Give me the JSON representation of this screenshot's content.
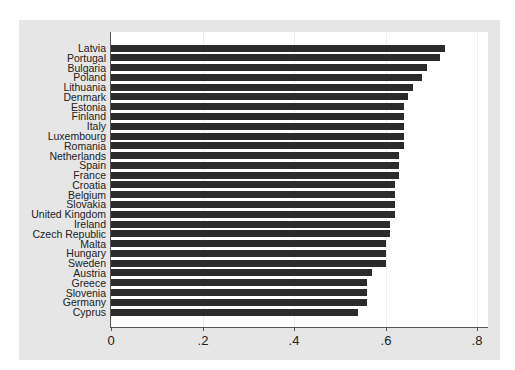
{
  "chart_data": {
    "type": "bar",
    "orientation": "horizontal",
    "title": "",
    "xlabel": "",
    "ylabel": "",
    "xlim": [
      0,
      0.82
    ],
    "xticks": [
      0,
      0.2,
      0.4,
      0.6,
      0.8
    ],
    "xtick_labels": [
      "0",
      ".2",
      ".4",
      ".6",
      ".8"
    ],
    "grid": true,
    "legend": null,
    "categories": [
      "Latvia",
      "Portugal",
      "Bulgaria",
      "Poland",
      "Lithuania",
      "Denmark",
      "Estonia",
      "Finland",
      "Italy",
      "Luxembourg",
      "Romania",
      "Netherlands",
      "Spain",
      "France",
      "Croatia",
      "Belgium",
      "Slovakia",
      "United Kingdom",
      "Ireland",
      "Czech Republic",
      "Malta",
      "Hungary",
      "Sweden",
      "Austria",
      "Greece",
      "Slovenia",
      "Germany",
      "Cyprus"
    ],
    "values": [
      0.73,
      0.72,
      0.69,
      0.68,
      0.66,
      0.65,
      0.64,
      0.64,
      0.64,
      0.64,
      0.64,
      0.63,
      0.63,
      0.63,
      0.62,
      0.62,
      0.62,
      0.62,
      0.61,
      0.61,
      0.6,
      0.6,
      0.6,
      0.57,
      0.56,
      0.56,
      0.56,
      0.54
    ]
  },
  "colors": {
    "bar": "#2b2b2b",
    "frame": "#e6e6e6",
    "plot": "#ffffff"
  }
}
